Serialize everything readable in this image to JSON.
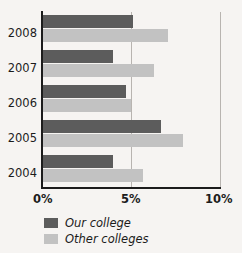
{
  "chart_data": {
    "type": "bar",
    "orientation": "horizontal",
    "title": "",
    "xlabel": "",
    "ylabel": "",
    "categories": [
      "2008",
      "2007",
      "2006",
      "2005",
      "2004"
    ],
    "series": [
      {
        "name": "Our college",
        "color": "#5c5c5c",
        "values": [
          5.1,
          4.0,
          4.7,
          6.7,
          4.0
        ]
      },
      {
        "name": "Other colleges",
        "color": "#c2c2c2",
        "values": [
          7.1,
          6.3,
          5.0,
          7.9,
          5.7
        ]
      }
    ],
    "xlim": [
      0,
      10
    ],
    "xticks": [
      0,
      5,
      10
    ],
    "xtick_labels": [
      "0%",
      "5%",
      "10%"
    ],
    "ytick_labels": [
      "2008",
      "2007",
      "2006",
      "2005",
      "2004"
    ],
    "grid": true,
    "gridlines_at": [
      5,
      10
    ],
    "legend_position": "bottom-left",
    "legend": [
      "Our college",
      "Other colleges"
    ]
  },
  "axes": {
    "x_ticks": [
      {
        "label": "0%"
      },
      {
        "label": "5%"
      },
      {
        "label": "10%"
      }
    ],
    "y_ticks": [
      {
        "label": "2008"
      },
      {
        "label": "2007"
      },
      {
        "label": "2006"
      },
      {
        "label": "2005"
      },
      {
        "label": "2004"
      }
    ]
  },
  "legend": {
    "items": [
      {
        "label": "Our college",
        "color": "#5c5c5c"
      },
      {
        "label": "Other colleges",
        "color": "#c2c2c2"
      }
    ]
  },
  "colors": {
    "background": "#f6f4f2",
    "axis": "#1c1c1c",
    "gridline": "#b8b4b0",
    "series_ours": "#5c5c5c",
    "series_others": "#c2c2c2"
  }
}
